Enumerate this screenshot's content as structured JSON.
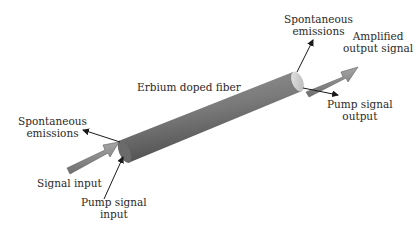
{
  "diagram": {
    "fiber": {
      "label": "Erbium doped fiber",
      "color": "#7a7a7a"
    },
    "labels": {
      "spont_right": [
        "Spontaneous",
        "emissions"
      ],
      "amplified_output": [
        "Amplified",
        "output signal"
      ],
      "pump_output": [
        "Pump signal",
        "output"
      ],
      "spont_left": [
        "Spontaneous",
        "emissions"
      ],
      "signal_input": [
        "Signal input"
      ],
      "pump_input": [
        "Pump signal",
        "input"
      ]
    },
    "colors": {
      "signal_arrow": "#8a8a8a",
      "line_arrow": "#1a1a1a",
      "text": "#2a2a2a"
    }
  }
}
